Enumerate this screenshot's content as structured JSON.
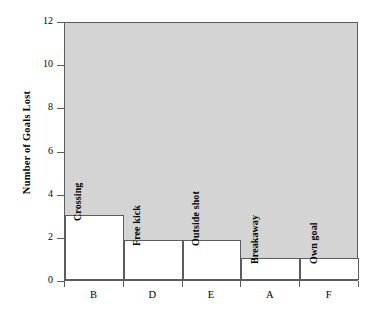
{
  "chart_data": {
    "type": "bar",
    "title": "",
    "xlabel": "",
    "ylabel": "Number of Goals Lost",
    "categories": [
      "B",
      "D",
      "E",
      "A",
      "F"
    ],
    "values": [
      3,
      1.85,
      1.85,
      1,
      1
    ],
    "bar_captions": [
      "Crossing",
      "Free kick",
      "Outside shot",
      "Breakaway",
      "Own goal"
    ],
    "ylim": [
      0,
      12
    ],
    "ytick_labels": [
      "0",
      "2",
      "4",
      "6",
      "8",
      "10",
      "12"
    ],
    "ytick_values": [
      0,
      2,
      4,
      6,
      8,
      10,
      12
    ],
    "grid": false,
    "legend": "none",
    "plot_background_color": "#d4d4d4",
    "bar_fill_color": "#ffffff",
    "bar_edge_color": "#5c5c5c",
    "axis_color": "#5c5c5c"
  }
}
